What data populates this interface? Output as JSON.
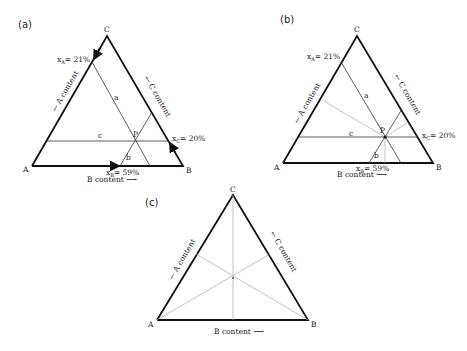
{
  "figure": {
    "panels": [
      {
        "id": "a",
        "panel_label": "(a)",
        "vertices": {
          "A": "A",
          "B": "B",
          "C": "C"
        },
        "axis_labels": {
          "a_content": "A content",
          "b_content": "B content",
          "c_content": "C content"
        },
        "line_labels": {
          "a": "a",
          "b": "b",
          "c": "c"
        },
        "point_label": "P",
        "annotations": {
          "xA": "x",
          "xA_sub": "A",
          "xA_val": "= 21%",
          "xB": "x",
          "xB_sub": "B",
          "xB_val": "= 59%",
          "xC": "x",
          "xC_sub": "C",
          "xC_val": "= 20%"
        }
      },
      {
        "id": "b",
        "panel_label": "(b)",
        "vertices": {
          "A": "A",
          "B": "B",
          "C": "C"
        },
        "axis_labels": {
          "a_content": "A content",
          "b_content": "B content",
          "c_content": "C content"
        },
        "line_labels": {
          "a": "a",
          "b": "b",
          "c": "c"
        },
        "point_label": "P",
        "annotations": {
          "xA": "x",
          "xA_sub": "A",
          "xA_val": "= 21%",
          "xB": "x",
          "xB_sub": "B",
          "xB_val": "= 59%",
          "xC": "x",
          "xC_sub": "C",
          "xC_val": "= 20%"
        }
      },
      {
        "id": "c",
        "panel_label": "(c)",
        "vertices": {
          "A": "A",
          "B": "B",
          "C": "C"
        },
        "axis_labels": {
          "a_content": "A content",
          "b_content": "B content",
          "c_content": "C content"
        }
      }
    ],
    "composition_P": {
      "A": 21,
      "B": 59,
      "C": 20
    }
  }
}
